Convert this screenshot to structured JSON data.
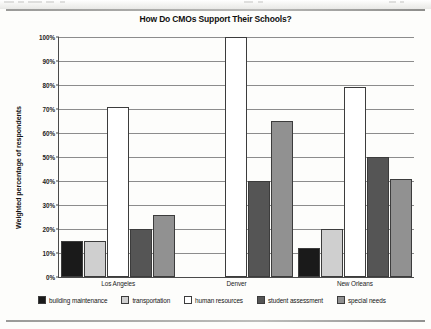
{
  "chart_data": {
    "type": "bar",
    "title": "How Do CMOs Support Their Schools?",
    "xlabel": "",
    "ylabel": "Weighted percentage of respondents",
    "ylim": [
      0,
      100
    ],
    "ytick_labels": [
      "100%",
      "90%",
      "80%",
      "70%",
      "60%",
      "50%",
      "40%",
      "30%",
      "20%",
      "10%",
      "0%"
    ],
    "ytick_values": [
      100,
      90,
      80,
      70,
      60,
      50,
      40,
      30,
      20,
      10,
      0
    ],
    "grid": true,
    "legend_position": "bottom",
    "categories": [
      "Los Angeles",
      "Denver",
      "New Orleans"
    ],
    "series": [
      {
        "name": "building maintenance",
        "color": "#1a1a1a",
        "values": [
          15,
          0,
          12
        ]
      },
      {
        "name": "transportation",
        "color": "#cfcfcf",
        "values": [
          15,
          0,
          20
        ]
      },
      {
        "name": "human resources",
        "color": "#ffffff",
        "values": [
          71,
          100,
          79
        ]
      },
      {
        "name": "student assessment",
        "color": "#555555",
        "values": [
          20,
          40,
          50
        ]
      },
      {
        "name": "special needs",
        "color": "#919191",
        "values": [
          26,
          65,
          41
        ]
      }
    ]
  },
  "page": {
    "title": "How Do CMOs Support Their Schools?"
  }
}
